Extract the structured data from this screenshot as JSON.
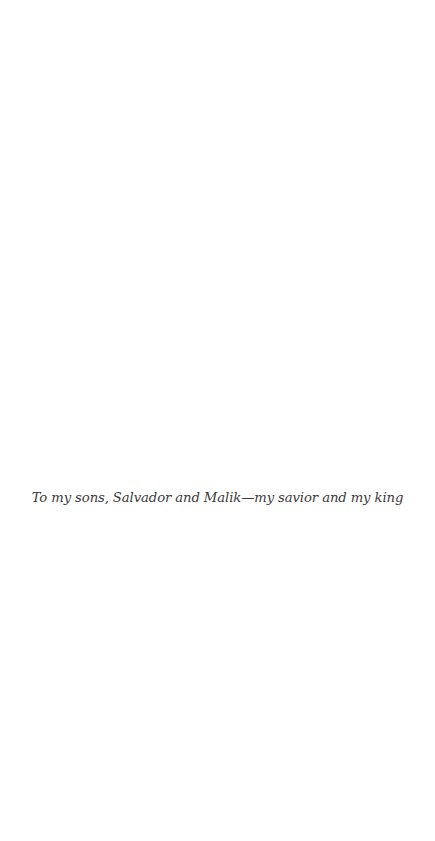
{
  "page": {
    "dedication": "To my sons, Salvador and Malik—my savior and my king"
  }
}
